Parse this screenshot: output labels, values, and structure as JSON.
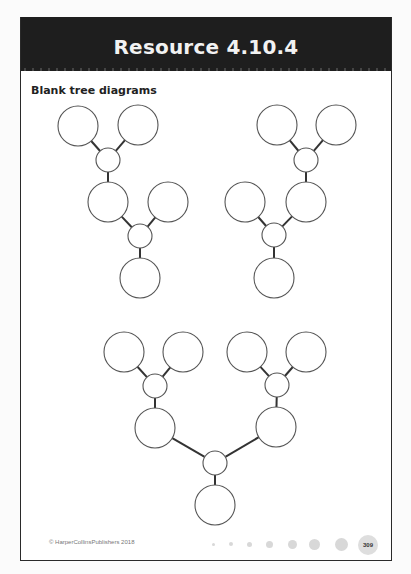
{
  "header": {
    "title": "Resource 4.10.4",
    "background_color": "#1e1e1e",
    "text_color": "#f2f2f2"
  },
  "section": {
    "subtitle": "Blank tree diagrams"
  },
  "diagrams": [
    {
      "name": "tree-1",
      "description": "Two-stage tree, top-left",
      "nodes": [
        {
          "id": "a1",
          "cx": 78,
          "cy": 126,
          "r": 20
        },
        {
          "id": "a2",
          "cx": 138,
          "cy": 125,
          "r": 20
        },
        {
          "id": "aj",
          "cx": 108,
          "cy": 160,
          "r": 12
        },
        {
          "id": "am",
          "cx": 108,
          "cy": 202,
          "r": 20
        },
        {
          "id": "ar",
          "cx": 168,
          "cy": 202,
          "r": 20
        },
        {
          "id": "aj2",
          "cx": 140,
          "cy": 236,
          "r": 12
        },
        {
          "id": "ab",
          "cx": 140,
          "cy": 278,
          "r": 20
        }
      ],
      "edges": [
        [
          "a1",
          "aj"
        ],
        [
          "a2",
          "aj"
        ],
        [
          "aj",
          "am"
        ],
        [
          "am",
          "aj2"
        ],
        [
          "ar",
          "aj2"
        ],
        [
          "aj2",
          "ab"
        ]
      ]
    },
    {
      "name": "tree-2",
      "description": "Two-stage tree, top-right",
      "nodes": [
        {
          "id": "b1",
          "cx": 277,
          "cy": 125,
          "r": 20
        },
        {
          "id": "b2",
          "cx": 336,
          "cy": 125,
          "r": 20
        },
        {
          "id": "bj",
          "cx": 306,
          "cy": 160,
          "r": 12
        },
        {
          "id": "bm",
          "cx": 306,
          "cy": 202,
          "r": 20
        },
        {
          "id": "bl",
          "cx": 245,
          "cy": 202,
          "r": 20
        },
        {
          "id": "bj2",
          "cx": 274,
          "cy": 235,
          "r": 12
        },
        {
          "id": "bb",
          "cx": 274,
          "cy": 278,
          "r": 20
        }
      ],
      "edges": [
        [
          "b1",
          "bj"
        ],
        [
          "b2",
          "bj"
        ],
        [
          "bj",
          "bm"
        ],
        [
          "bl",
          "bj2"
        ],
        [
          "bm",
          "bj2"
        ],
        [
          "bj2",
          "bb"
        ]
      ]
    },
    {
      "name": "tree-3",
      "description": "Symmetric tree, bottom center",
      "nodes": [
        {
          "id": "c1",
          "cx": 124,
          "cy": 352,
          "r": 20
        },
        {
          "id": "c2",
          "cx": 183,
          "cy": 352,
          "r": 20
        },
        {
          "id": "cjl",
          "cx": 155,
          "cy": 386,
          "r": 12
        },
        {
          "id": "cml",
          "cx": 155,
          "cy": 428,
          "r": 20
        },
        {
          "id": "c3",
          "cx": 247,
          "cy": 352,
          "r": 20
        },
        {
          "id": "c4",
          "cx": 306,
          "cy": 352,
          "r": 20
        },
        {
          "id": "cjr",
          "cx": 277,
          "cy": 385,
          "r": 12
        },
        {
          "id": "cmr",
          "cx": 276,
          "cy": 427,
          "r": 20
        },
        {
          "id": "cjc",
          "cx": 215,
          "cy": 463,
          "r": 12
        },
        {
          "id": "cb",
          "cx": 215,
          "cy": 505,
          "r": 20
        }
      ],
      "edges": [
        [
          "c1",
          "cjl"
        ],
        [
          "c2",
          "cjl"
        ],
        [
          "cjl",
          "cml"
        ],
        [
          "c3",
          "cjr"
        ],
        [
          "c4",
          "cjr"
        ],
        [
          "cjr",
          "cmr"
        ],
        [
          "cml",
          "cjc"
        ],
        [
          "cmr",
          "cjc"
        ],
        [
          "cjc",
          "cb"
        ]
      ]
    }
  ],
  "footer": {
    "copyright": "© HarperCollinsPublishers 2018",
    "page_number": "309",
    "dots": [
      {
        "x": 212,
        "size": 3
      },
      {
        "x": 230,
        "size": 4
      },
      {
        "x": 248,
        "size": 5
      },
      {
        "x": 268,
        "size": 7
      },
      {
        "x": 291,
        "size": 9
      },
      {
        "x": 313,
        "size": 11
      },
      {
        "x": 340,
        "size": 13
      }
    ]
  }
}
